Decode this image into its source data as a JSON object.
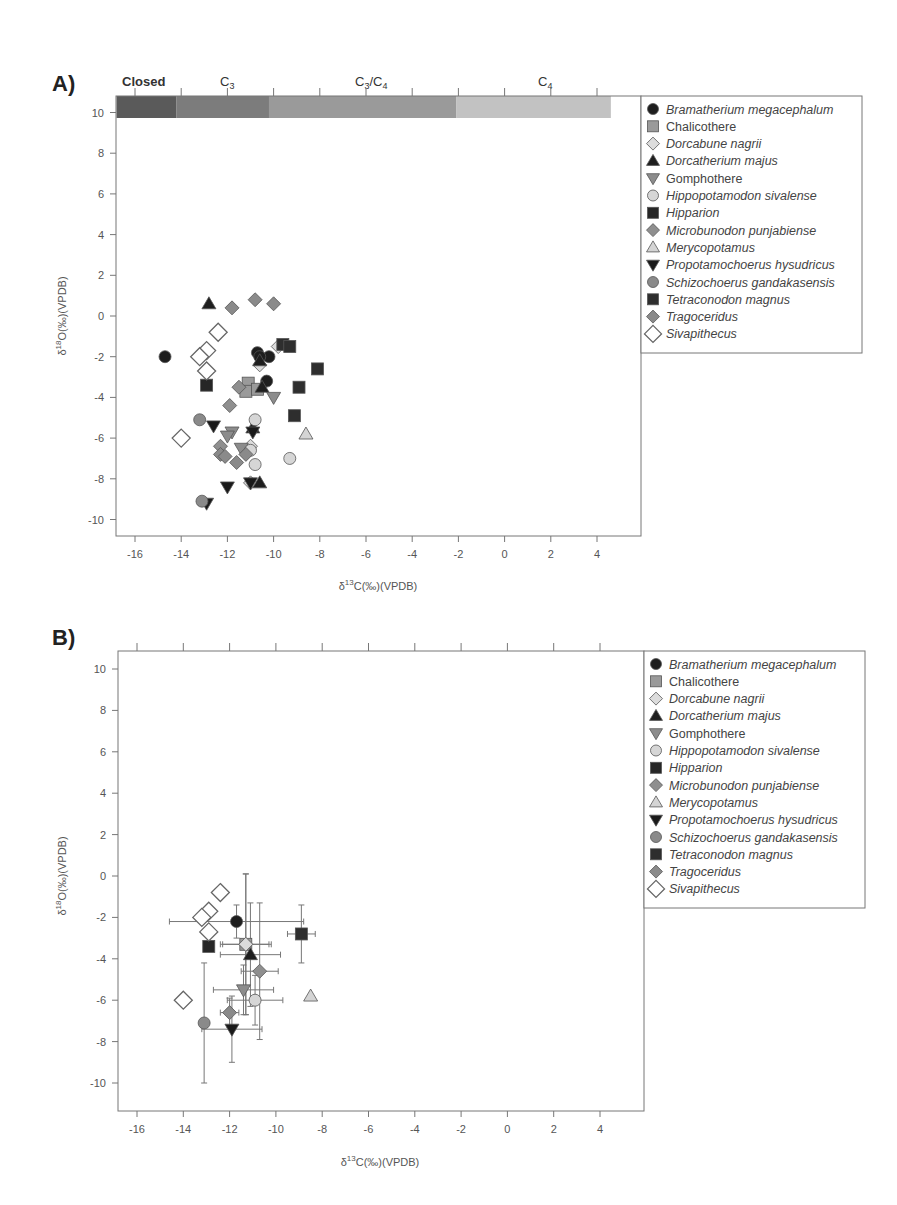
{
  "chart_data": [
    {
      "panel": "A)",
      "type": "scatter",
      "title": "",
      "xlabel": "δ13C(‰)(VPDB)",
      "ylabel": "δ18O(‰)(VPDB)",
      "xlim": [
        -16.8,
        4.8
      ],
      "ylim": [
        -10.9,
        10.8
      ],
      "xticks": [
        -16,
        -14,
        -12,
        -10,
        -8,
        -6,
        -4,
        -2,
        0,
        2,
        4
      ],
      "yticks": [
        -10,
        -8,
        -6,
        -4,
        -2,
        0,
        2,
        4,
        6,
        8,
        10
      ],
      "grid": false,
      "legend_position": "right-outside",
      "vegetation_bands": [
        {
          "label": "Closed",
          "x0": -16.8,
          "x1": -14.2,
          "color": "#5a5a5a"
        },
        {
          "label": "C3",
          "x0": -14.2,
          "x1": -10.2,
          "color": "#7c7c7c"
        },
        {
          "label": "C3/C4",
          "x0": -10.2,
          "x1": -2.1,
          "color": "#9a9a9a"
        },
        {
          "label": "C4",
          "x0": -2.1,
          "x1": 4.6,
          "color": "#c2c2c2"
        }
      ],
      "series": [
        {
          "name": "Bramatherium megacephalum",
          "marker": "circle",
          "points": [
            [
              -14.7,
              -2.0
            ],
            [
              -10.7,
              -1.8
            ],
            [
              -10.2,
              -2.0
            ],
            [
              -10.6,
              -2.0
            ],
            [
              -10.3,
              -3.2
            ]
          ]
        },
        {
          "name": "Chalicothere",
          "marker": "square",
          "points": [
            [
              -11.1,
              -3.3
            ],
            [
              -11.2,
              -3.7
            ],
            [
              -10.7,
              -3.6
            ]
          ]
        },
        {
          "name": "Dorcabune nagrii",
          "marker": "diamond",
          "points": [
            [
              -9.8,
              -1.5
            ],
            [
              -10.6,
              -2.4
            ],
            [
              -11.0,
              -6.4
            ],
            [
              -11.0,
              -8.2
            ]
          ]
        },
        {
          "name": "Dorcatherium majus",
          "marker": "triangle-up",
          "points": [
            [
              -12.8,
              0.6
            ],
            [
              -10.6,
              -2.2
            ],
            [
              -10.5,
              -3.5
            ],
            [
              -10.6,
              -8.2
            ],
            [
              -10.9,
              -5.5
            ]
          ]
        },
        {
          "name": "Gomphothere",
          "marker": "triangle-down",
          "points": [
            [
              -10.0,
              -4.0
            ],
            [
              -11.8,
              -5.7
            ],
            [
              -12.0,
              -5.9
            ],
            [
              -11.4,
              -6.5
            ]
          ]
        },
        {
          "name": "Hippopotamodon sivalense",
          "marker": "circle",
          "points": [
            [
              -10.8,
              -5.1
            ],
            [
              -9.3,
              -7.0
            ],
            [
              -10.8,
              -7.3
            ],
            [
              -11.0,
              -6.6
            ]
          ]
        },
        {
          "name": "Hipparion",
          "marker": "square",
          "points": [
            [
              -12.9,
              -3.4
            ]
          ]
        },
        {
          "name": "Microbunodon punjabiense",
          "marker": "diamond",
          "points": [
            [
              -11.5,
              -3.5
            ],
            [
              -11.9,
              -4.4
            ],
            [
              -12.3,
              -6.4
            ]
          ]
        },
        {
          "name": "Merycopotamus",
          "marker": "triangle-up",
          "points": [
            [
              -8.6,
              -5.8
            ]
          ]
        },
        {
          "name": "Propotamochoerus hysudricus",
          "marker": "triangle-down",
          "points": [
            [
              -12.6,
              -5.4
            ],
            [
              -12.0,
              -8.4
            ],
            [
              -11.0,
              -8.2
            ],
            [
              -12.9,
              -9.2
            ],
            [
              -10.9,
              -5.7
            ]
          ]
        },
        {
          "name": "Schizochoerus gandakasensis",
          "marker": "circle",
          "points": [
            [
              -13.2,
              -5.1
            ],
            [
              -13.1,
              -9.1
            ]
          ]
        },
        {
          "name": "Tetraconodon magnus",
          "marker": "square",
          "points": [
            [
              -9.6,
              -1.4
            ],
            [
              -9.3,
              -1.5
            ],
            [
              -8.1,
              -2.6
            ],
            [
              -8.9,
              -3.5
            ],
            [
              -9.1,
              -4.9
            ]
          ]
        },
        {
          "name": "Tragoceridus",
          "marker": "diamond",
          "points": [
            [
              -11.8,
              0.4
            ],
            [
              -10.8,
              0.8
            ],
            [
              -10.0,
              0.6
            ],
            [
              -12.3,
              -6.8
            ],
            [
              -12.1,
              -6.9
            ],
            [
              -11.6,
              -7.2
            ],
            [
              -11.2,
              -6.8
            ]
          ]
        },
        {
          "name": "Sivapithecus",
          "marker": "diamond-open",
          "points": [
            [
              -12.4,
              -0.8
            ],
            [
              -12.9,
              -1.7
            ],
            [
              -13.2,
              -2.0
            ],
            [
              -12.9,
              -2.7
            ],
            [
              -14.0,
              -6.0
            ]
          ]
        }
      ]
    },
    {
      "panel": "B)",
      "type": "scatter",
      "title": "",
      "xlabel": "δ13C(‰)(VPDB)",
      "ylabel": "δ18O(‰)(VPDB)",
      "xlim": [
        -16.8,
        4.8
      ],
      "ylim": [
        -10.9,
        10.8
      ],
      "xticks": [
        -16,
        -14,
        -12,
        -10,
        -8,
        -6,
        -4,
        -2,
        0,
        2,
        4
      ],
      "yticks": [
        -10,
        -8,
        -6,
        -4,
        -2,
        0,
        2,
        4,
        6,
        8,
        10
      ],
      "grid": false,
      "legend_position": "right-outside",
      "error_bars": true,
      "series": [
        {
          "name": "Bramatherium megacephalum",
          "marker": "circle",
          "x": -11.7,
          "y": -2.2,
          "xerr": 2.9,
          "yerr": 0.8
        },
        {
          "name": "Chalicothere",
          "marker": "square",
          "x": -11.3,
          "y": -3.3,
          "xerr": 1.0,
          "yerr": 3.4
        },
        {
          "name": "Dorcabune nagrii",
          "marker": "diamond",
          "x": -11.3,
          "y": -3.3,
          "xerr": 1.1,
          "yerr": 3.4
        },
        {
          "name": "Dorcatherium majus",
          "marker": "triangle-up",
          "x": -11.1,
          "y": -3.8,
          "xerr": 1.3,
          "yerr": 2.5
        },
        {
          "name": "Gomphothere",
          "marker": "triangle-down",
          "x": -11.4,
          "y": -5.5,
          "xerr": 1.3,
          "yerr": 1.2
        },
        {
          "name": "Hippopotamodon sivalense",
          "marker": "circle",
          "x": -10.9,
          "y": -6.0,
          "xerr": 1.2,
          "yerr": 1.2
        },
        {
          "name": "Hipparion",
          "marker": "square",
          "x": -12.9,
          "y": -3.4,
          "xerr": 0,
          "yerr": 0
        },
        {
          "name": "Microbunodon punjabiense",
          "marker": "diamond",
          "x": -10.7,
          "y": -4.6,
          "xerr": 0.8,
          "yerr": 3.3
        },
        {
          "name": "Merycopotamus",
          "marker": "triangle-up",
          "x": -8.5,
          "y": -5.8,
          "xerr": 0,
          "yerr": 0
        },
        {
          "name": "Propotamochoerus hysudricus",
          "marker": "triangle-down",
          "x": -11.9,
          "y": -7.4,
          "xerr": 1.3,
          "yerr": 1.6
        },
        {
          "name": "Schizochoerus gandakasensis",
          "marker": "circle",
          "x": -13.1,
          "y": -7.1,
          "xerr": 0,
          "yerr": 2.9
        },
        {
          "name": "Tetraconodon magnus",
          "marker": "square",
          "x": -8.9,
          "y": -2.8,
          "xerr": 0.6,
          "yerr": 1.4
        },
        {
          "name": "Tragoceridus",
          "marker": "diamond",
          "x": -12.0,
          "y": -6.6,
          "xerr": 0.4,
          "yerr": 0.7
        },
        {
          "name": "Sivapithecus",
          "marker": "diamond-open",
          "points": [
            [
              -12.4,
              -0.8
            ],
            [
              -12.9,
              -1.7
            ],
            [
              -13.2,
              -2.0
            ],
            [
              -12.9,
              -2.7
            ],
            [
              -14.0,
              -6.0
            ]
          ]
        }
      ]
    }
  ],
  "panels": {
    "a_label": "A)",
    "b_label": "B)",
    "xlabel_prefix": "δ",
    "xlabel_sup": "13",
    "xlabel_rest": "C(‰)(VPDB)",
    "ylabel_prefix": "δ",
    "ylabel_sup": "18",
    "ylabel_rest": "O(‰)(VPDB)",
    "bands": {
      "closed": "Closed",
      "c3": "C",
      "c3_sub": "3",
      "c3c4_a": "C",
      "c3c4_a_sub": "3",
      "c3c4_slash": "/",
      "c3c4_b": "C",
      "c3c4_b_sub": "4",
      "c4": "C",
      "c4_sub": "4"
    }
  },
  "legend": [
    {
      "label": "Bramatherium megacephalum",
      "italic": true,
      "marker": "circle",
      "fill": "#1e1e1e"
    },
    {
      "label": "Chalicothere",
      "italic": false,
      "marker": "square",
      "fill": "#9a9a9a"
    },
    {
      "label": "Dorcabune nagrii",
      "italic": true,
      "marker": "diamond",
      "fill": "#dcdcdc"
    },
    {
      "label": "Dorcatherium majus",
      "italic": true,
      "marker": "triangle-up",
      "fill": "#1e1e1e"
    },
    {
      "label": "Gomphothere",
      "italic": false,
      "marker": "triangle-down",
      "fill": "#8c8c8c"
    },
    {
      "label": "Hippopotamodon sivalense",
      "italic": true,
      "marker": "circle",
      "fill": "#d6d6d6"
    },
    {
      "label": "Hipparion",
      "italic": true,
      "marker": "square",
      "fill": "#262626"
    },
    {
      "label": "Microbunodon punjabiense",
      "italic": true,
      "marker": "diamond",
      "fill": "#8f8f8f"
    },
    {
      "label": "Merycopotamus",
      "italic": true,
      "marker": "triangle-up",
      "fill": "#d4d4d4"
    },
    {
      "label": "Propotamochoerus hysudricus",
      "italic": true,
      "marker": "triangle-down",
      "fill": "#1a1a1a"
    },
    {
      "label": "Schizochoerus gandakasensis",
      "italic": true,
      "marker": "circle",
      "fill": "#8a8a8a"
    },
    {
      "label": "Tetraconodon magnus",
      "italic": true,
      "marker": "square",
      "fill": "#2e2e2e"
    },
    {
      "label": "Tragoceridus",
      "italic": true,
      "marker": "diamond",
      "fill": "#8a8a8a"
    },
    {
      "label": "Sivapithecus",
      "italic": true,
      "marker": "diamond-open",
      "fill": "#ffffff"
    }
  ]
}
